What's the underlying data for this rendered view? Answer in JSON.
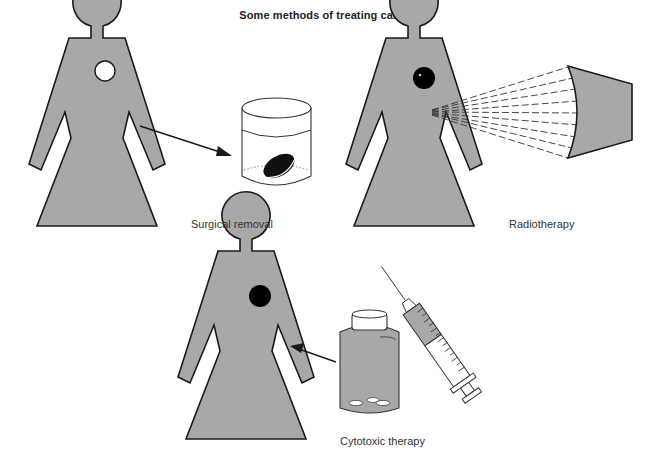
{
  "title": "Some methods of treating cancer",
  "panels": [
    {
      "id": "surgical",
      "caption": "Surgical removal",
      "tumour": "removed (white hole)",
      "tool": "specimen jar"
    },
    {
      "id": "radio",
      "caption": "Radiotherapy",
      "tumour": "black",
      "tool": "radiation source with dashed beams"
    },
    {
      "id": "cytotoxic",
      "caption": "Cytotoxic therapy",
      "tumour": "black",
      "tool": "pill bottle and syringe"
    }
  ],
  "colors": {
    "figure_fill": "#a8a8a8",
    "outline": "#1a1a1a",
    "tumour": "#000000",
    "background": "#ffffff"
  }
}
